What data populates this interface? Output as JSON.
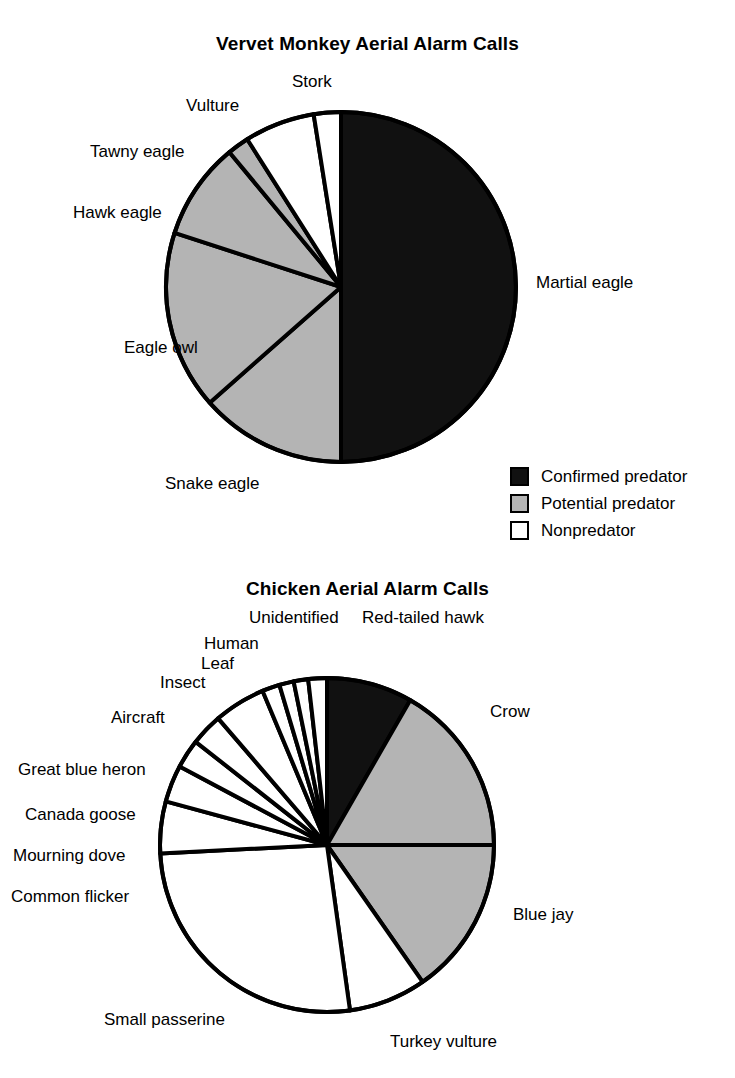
{
  "charts": [
    {
      "title": "Vervet Monkey Aerial Alarm Calls",
      "labels": {
        "stork": "Stork",
        "vulture": "Vulture",
        "tawny_eagle": "Tawny eagle",
        "hawk_eagle": "Hawk eagle",
        "eagle_owl": "Eagle owl",
        "snake_eagle": "Snake eagle",
        "martial_eagle": "Martial eagle"
      }
    },
    {
      "title": "Chicken Aerial Alarm Calls",
      "labels": {
        "unidentified": "Unidentified",
        "human": "Human",
        "leaf": "Leaf",
        "insect": "Insect",
        "aircraft": "Aircraft",
        "great_blue_heron": "Great blue heron",
        "canada_goose": "Canada goose",
        "mourning_dove": "Mourning dove",
        "common_flicker": "Common flicker",
        "small_passerine": "Small passerine",
        "turkey_vulture": "Turkey vulture",
        "blue_jay": "Blue jay",
        "crow": "Crow",
        "red_tailed_hawk": "Red-tailed hawk"
      }
    }
  ],
  "legend": {
    "items": [
      {
        "label": "Confirmed predator",
        "swatch": "black",
        "color": "#111111"
      },
      {
        "label": "Potential predator",
        "swatch": "gray",
        "color": "#b4b4b4"
      },
      {
        "label": "Nonpredator",
        "swatch": "white",
        "color": "#ffffff"
      }
    ]
  },
  "colors": {
    "confirmed_predator": "#111111",
    "potential_predator": "#b4b4b4",
    "nonpredator": "#ffffff",
    "outline": "#000000"
  },
  "chart_data": [
    {
      "type": "pie",
      "title": "Vervet Monkey Aerial Alarm Calls",
      "legend_position": "right-middle",
      "start_angle_deg": 0,
      "direction": "clockwise",
      "center": [
        341,
        287
      ],
      "radius": 175,
      "categories": [
        "Martial eagle",
        "Snake eagle",
        "Eagle owl",
        "Hawk eagle",
        "Tawny eagle",
        "Vulture",
        "Stork"
      ],
      "values": [
        50.0,
        13.5,
        16.5,
        9.0,
        2.0,
        6.5,
        2.5
      ],
      "units": "percent of aerial alarm calls",
      "slice_classes": [
        "Confirmed predator",
        "Potential predator",
        "Potential predator",
        "Potential predator",
        "Potential predator",
        "Nonpredator",
        "Nonpredator"
      ],
      "slice_colors": [
        "#111111",
        "#b4b4b4",
        "#b4b4b4",
        "#b4b4b4",
        "#b4b4b4",
        "#ffffff",
        "#ffffff"
      ]
    },
    {
      "type": "pie",
      "title": "Chicken Aerial Alarm Calls",
      "legend_position": "shared-with-chart-1",
      "start_angle_deg": 0,
      "direction": "clockwise",
      "center": [
        327,
        845
      ],
      "radius": 167,
      "categories": [
        "Red-tailed hawk",
        "Crow",
        "Blue jay",
        "Turkey vulture",
        "Small passerine",
        "Common flicker",
        "Mourning dove",
        "Canada goose",
        "Great blue heron",
        "Aircraft",
        "Insect",
        "Leaf",
        "Human",
        "Unidentified"
      ],
      "values": [
        8.3,
        16.7,
        15.3,
        7.5,
        26.4,
        5.0,
        3.6,
        2.8,
        3.1,
        5.0,
        1.7,
        1.4,
        1.4,
        1.8
      ],
      "units": "percent of aerial alarm calls",
      "slice_classes": [
        "Confirmed predator",
        "Potential predator",
        "Potential predator",
        "Nonpredator",
        "Nonpredator",
        "Nonpredator",
        "Nonpredator",
        "Nonpredator",
        "Nonpredator",
        "Nonpredator",
        "Nonpredator",
        "Nonpredator",
        "Nonpredator",
        "Nonpredator"
      ],
      "slice_colors": [
        "#111111",
        "#b4b4b4",
        "#b4b4b4",
        "#ffffff",
        "#ffffff",
        "#ffffff",
        "#ffffff",
        "#ffffff",
        "#ffffff",
        "#ffffff",
        "#ffffff",
        "#ffffff",
        "#ffffff",
        "#ffffff"
      ]
    }
  ]
}
